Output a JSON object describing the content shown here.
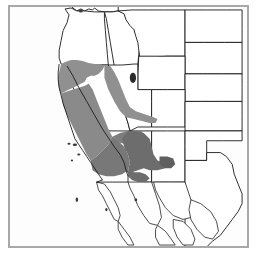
{
  "figure": {
    "kind": "distribution-range-map",
    "region": "Western United States and northern Mexico",
    "background_color": "#ffffff",
    "frame_color": "#a8a8a8",
    "border_color": "#1a1a1a"
  },
  "legend_colors": {
    "range_light_gray": "#909090",
    "range_dark_gray": "#6d6d6d",
    "lake_fill": "#2a2a2a",
    "island_fill": "#3a3a3a",
    "land_fill": "#ffffff"
  },
  "map_features": {
    "states": [
      {
        "name": "Washington",
        "shaded": false
      },
      {
        "name": "Oregon",
        "shaded": false
      },
      {
        "name": "Idaho",
        "shaded": false
      },
      {
        "name": "Montana",
        "shaded": false
      },
      {
        "name": "North Dakota",
        "shaded": false
      },
      {
        "name": "South Dakota",
        "shaded": false
      },
      {
        "name": "Wyoming",
        "shaded": false
      },
      {
        "name": "Nebraska",
        "shaded": false
      },
      {
        "name": "California",
        "shaded": true
      },
      {
        "name": "Nevada",
        "shaded": true
      },
      {
        "name": "Utah",
        "shaded": true
      },
      {
        "name": "Colorado",
        "shaded": false
      },
      {
        "name": "Kansas",
        "shaded": false
      },
      {
        "name": "Arizona",
        "shaded": true
      },
      {
        "name": "New Mexico",
        "shaded": false
      },
      {
        "name": "Oklahoma",
        "shaded": false
      },
      {
        "name": "Texas",
        "shaded": false
      }
    ],
    "water_bodies": [
      {
        "name": "Great Salt Lake"
      }
    ],
    "islands": [
      {
        "name": "Channel Islands"
      }
    ],
    "mexico_states": [
      {
        "name": "Baja California"
      },
      {
        "name": "Baja California Sur"
      },
      {
        "name": "Sonora"
      },
      {
        "name": "Chihuahua"
      },
      {
        "name": "Sinaloa"
      },
      {
        "name": "Durango"
      },
      {
        "name": "Coahuila"
      }
    ]
  },
  "range_polygons": {
    "light_gray_note": "Northern California coastal ranges and Sierra Nevada foothills plus western Nevada",
    "dark_gray_note": "Southern California, southern Nevada, and western Arizona desert range"
  }
}
